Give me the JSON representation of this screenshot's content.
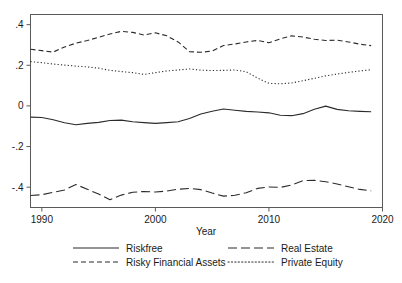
{
  "chart_data": {
    "type": "line",
    "title": "",
    "xlabel": "Year",
    "ylabel": "",
    "xlim": [
      1989,
      2020
    ],
    "ylim": [
      -0.5,
      0.45
    ],
    "xticks": [
      1990,
      2000,
      2010,
      2020
    ],
    "xtick_labels": [
      "1990",
      "2000",
      "2010",
      "2020"
    ],
    "yticks": [
      0.4,
      0.2,
      0,
      -0.2,
      -0.4
    ],
    "ytick_labels": [
      ".4",
      ".2",
      "0",
      "-.2",
      "-.4"
    ],
    "grid": false,
    "legend_position": "bottom",
    "x": [
      1989,
      1990,
      1991,
      1992,
      1993,
      1994,
      1995,
      1996,
      1997,
      1998,
      1999,
      2000,
      2001,
      2002,
      2003,
      2004,
      2005,
      2006,
      2007,
      2008,
      2009,
      2010,
      2011,
      2012,
      2013,
      2014,
      2015,
      2016,
      2017,
      2018,
      2019
    ],
    "series": [
      {
        "name": "Riskfree",
        "style": "solid",
        "values": [
          -0.055,
          -0.057,
          -0.068,
          -0.083,
          -0.093,
          -0.086,
          -0.081,
          -0.072,
          -0.07,
          -0.078,
          -0.082,
          -0.086,
          -0.082,
          -0.078,
          -0.062,
          -0.04,
          -0.026,
          -0.015,
          -0.021,
          -0.027,
          -0.03,
          -0.034,
          -0.046,
          -0.048,
          -0.038,
          -0.016,
          -0.001,
          -0.017,
          -0.024,
          -0.027,
          -0.029
        ]
      },
      {
        "name": "Risky Financial Assets",
        "style": "dashed",
        "values": [
          0.279,
          0.272,
          0.265,
          0.29,
          0.309,
          0.322,
          0.338,
          0.354,
          0.367,
          0.362,
          0.349,
          0.36,
          0.345,
          0.315,
          0.267,
          0.264,
          0.27,
          0.297,
          0.305,
          0.315,
          0.322,
          0.311,
          0.33,
          0.345,
          0.339,
          0.328,
          0.322,
          0.324,
          0.315,
          0.304,
          0.297
        ]
      },
      {
        "name": "Real Estate",
        "style": "longdash",
        "values": [
          -0.441,
          -0.437,
          -0.425,
          -0.414,
          -0.387,
          -0.41,
          -0.434,
          -0.462,
          -0.439,
          -0.425,
          -0.421,
          -0.424,
          -0.419,
          -0.41,
          -0.406,
          -0.412,
          -0.429,
          -0.444,
          -0.44,
          -0.427,
          -0.406,
          -0.399,
          -0.401,
          -0.389,
          -0.368,
          -0.366,
          -0.373,
          -0.384,
          -0.398,
          -0.411,
          -0.418
        ]
      },
      {
        "name": "Private Equity",
        "style": "dotted",
        "values": [
          0.218,
          0.213,
          0.206,
          0.201,
          0.196,
          0.192,
          0.186,
          0.175,
          0.169,
          0.164,
          0.155,
          0.164,
          0.172,
          0.177,
          0.182,
          0.176,
          0.174,
          0.175,
          0.177,
          0.168,
          0.137,
          0.111,
          0.109,
          0.113,
          0.124,
          0.136,
          0.148,
          0.157,
          0.165,
          0.172,
          0.178
        ]
      }
    ]
  },
  "legend": {
    "entries": [
      {
        "label": "Riskfree",
        "style": "solid"
      },
      {
        "label": "Real Estate",
        "style": "longdash"
      },
      {
        "label": "Risky Financial Assets",
        "style": "dashed"
      },
      {
        "label": "Private Equity",
        "style": "dotted"
      }
    ]
  }
}
